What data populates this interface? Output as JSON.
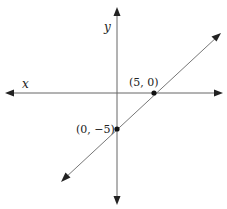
{
  "diagram": {
    "axes": {
      "x_label": "x",
      "y_label": "y",
      "color": "#555555"
    },
    "line": {
      "color": "#555555",
      "description": "line through (5,0) and (0,-5)"
    },
    "points": [
      {
        "label": "(5, 0)",
        "x": 5,
        "y": 0
      },
      {
        "label": "(0, −5)",
        "x": 0,
        "y": -5
      }
    ]
  }
}
